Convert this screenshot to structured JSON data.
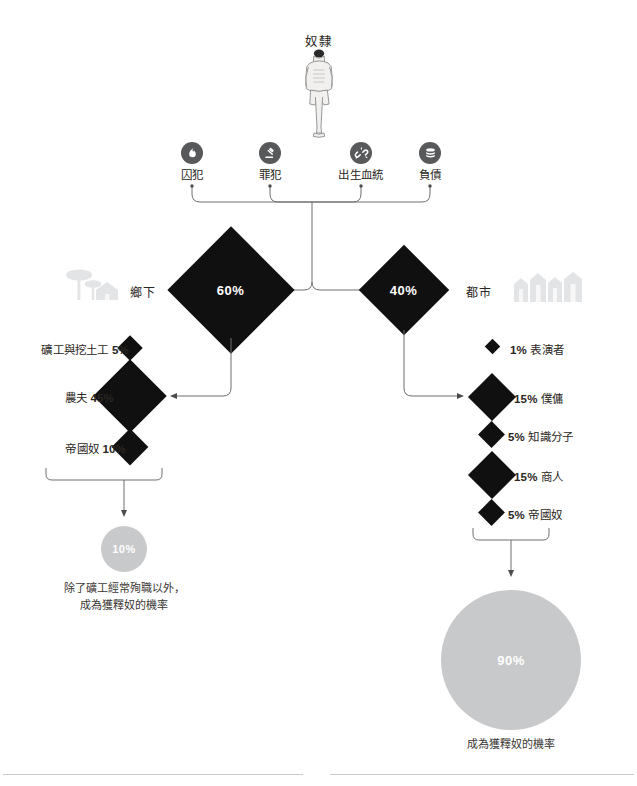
{
  "title": "奴隸",
  "figure": {
    "icon": "standing-slave-figure"
  },
  "sources": [
    {
      "label": "囚犯",
      "icon": "flame-icon",
      "x": 192
    },
    {
      "label": "罪犯",
      "icon": "gavel-icon",
      "x": 270
    },
    {
      "label": "出生血統",
      "icon": "broken-link-icon",
      "x": 361
    },
    {
      "label": "負債",
      "icon": "coins-icon",
      "x": 430
    }
  ],
  "regions": {
    "rural": {
      "label": "鄉下",
      "value": "60%",
      "icon": "tree-house-icon"
    },
    "urban": {
      "label": "都市",
      "value": "40%",
      "icon": "city-buildings-icon"
    }
  },
  "rural_occupations": [
    {
      "label": "礦工與挖土工",
      "value": "5%",
      "size": 18
    },
    {
      "label": "農夫",
      "value": "45%",
      "size": 52
    },
    {
      "label": "帝國奴",
      "value": "10%",
      "size": 26
    }
  ],
  "urban_occupations": [
    {
      "label": "表演者",
      "value": "1%",
      "size": 11
    },
    {
      "label": "僕傭",
      "value": "15%",
      "size": 34
    },
    {
      "label": "知識分子",
      "value": "5%",
      "size": 19
    },
    {
      "label": "商人",
      "value": "15%",
      "size": 34
    },
    {
      "label": "帝國奴",
      "value": "5%",
      "size": 19
    }
  ],
  "outcomes": {
    "rural": {
      "value": "10%",
      "caption": "除了礦工經常殉職以外，\n成為獲釋奴的機率",
      "diameter": 46
    },
    "urban": {
      "value": "90%",
      "caption": "成為獲釋奴的機率",
      "diameter": 140
    }
  },
  "colors": {
    "ink": "#111010",
    "text": "#2a2622",
    "icon_circle": "#58595b",
    "circle_fill": "#c8c9ca",
    "line": "#6d6e70",
    "rule": "#c9cacb",
    "ghost": "#e3e4e5"
  }
}
